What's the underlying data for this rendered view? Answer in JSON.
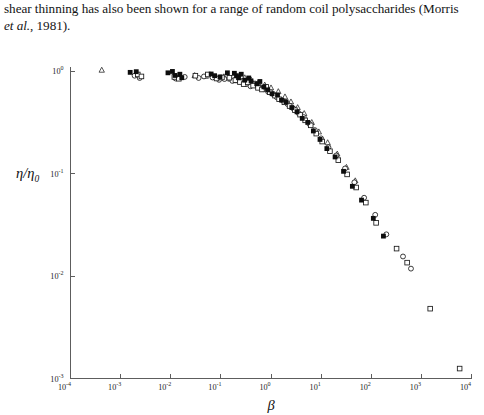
{
  "page": {
    "paragraph_line_1": "shear thinning has also been shown for a range of random coil polysaccharides (Morris",
    "paragraph_line_2_italic": "et al.",
    "paragraph_line_2_rest": ", 1981)."
  },
  "chart_data": {
    "type": "scatter",
    "title": "",
    "xlabel": "β",
    "ylabel": "η/η₀",
    "xscale": "log",
    "yscale": "log",
    "xlim": [
      0.0001,
      10000
    ],
    "ylim": [
      0.001,
      1
    ],
    "grid": false,
    "legend": "none",
    "xtick_labels": [
      "10-4",
      "10-3",
      "10-2",
      "10-1",
      "100",
      "101",
      "102",
      "103",
      "104"
    ],
    "xtick_mantissa": "10",
    "xtick_exponents": [
      "-4",
      "-3",
      "-2",
      "-1",
      "0",
      "1",
      "2",
      "3",
      "4"
    ],
    "ytick_mantissa": "10",
    "ytick_exponents": [
      "0",
      "-1",
      "-2",
      "-3"
    ],
    "series": [
      {
        "name": "filled-square",
        "marker": "filled-square",
        "points": [
          [
            0.00155,
            0.97
          ],
          [
            0.00205,
            0.985
          ],
          [
            0.0088,
            0.96
          ],
          [
            0.0108,
            0.99
          ],
          [
            0.0122,
            0.905
          ],
          [
            0.0152,
            0.93
          ],
          [
            0.0166,
            0.86
          ],
          [
            0.064,
            0.935
          ],
          [
            0.075,
            0.9
          ],
          [
            0.096,
            0.875
          ],
          [
            0.135,
            0.96
          ],
          [
            0.186,
            0.95
          ],
          [
            0.205,
            0.9
          ],
          [
            0.225,
            0.86
          ],
          [
            0.255,
            0.93
          ],
          [
            0.3,
            0.815
          ],
          [
            0.36,
            0.855
          ],
          [
            0.4,
            0.8
          ],
          [
            0.52,
            0.75
          ],
          [
            0.6,
            0.79
          ],
          [
            0.72,
            0.7
          ],
          [
            0.86,
            0.655
          ],
          [
            1.05,
            0.6
          ],
          [
            1.35,
            0.585
          ],
          [
            1.62,
            0.52
          ],
          [
            2.0,
            0.5
          ],
          [
            2.6,
            0.44
          ],
          [
            3.3,
            0.4
          ],
          [
            4.2,
            0.345
          ],
          [
            5.4,
            0.315
          ],
          [
            7.0,
            0.26
          ],
          [
            9.5,
            0.215
          ],
          [
            13.0,
            0.175
          ],
          [
            19.0,
            0.145
          ],
          [
            28.0,
            0.105
          ],
          [
            42.0,
            0.075
          ],
          [
            64.0,
            0.055
          ],
          [
            110.0,
            0.0365
          ],
          [
            175.0,
            0.0245
          ]
        ]
      },
      {
        "name": "open-square",
        "marker": "open-square",
        "points": [
          [
            0.0022,
            0.925
          ],
          [
            0.0026,
            0.885
          ],
          [
            0.0118,
            0.875
          ],
          [
            0.0145,
            0.84
          ],
          [
            0.031,
            0.9
          ],
          [
            0.055,
            0.925
          ],
          [
            0.082,
            0.845
          ],
          [
            0.105,
            0.865
          ],
          [
            0.148,
            0.86
          ],
          [
            0.195,
            0.815
          ],
          [
            0.24,
            0.78
          ],
          [
            0.285,
            0.745
          ],
          [
            0.345,
            0.775
          ],
          [
            0.44,
            0.72
          ],
          [
            0.55,
            0.685
          ],
          [
            0.66,
            0.66
          ],
          [
            0.8,
            0.7
          ],
          [
            0.95,
            0.62
          ],
          [
            1.2,
            0.575
          ],
          [
            1.45,
            0.53
          ],
          [
            1.85,
            0.495
          ],
          [
            2.35,
            0.455
          ],
          [
            3.0,
            0.415
          ],
          [
            3.8,
            0.375
          ],
          [
            4.8,
            0.33
          ],
          [
            6.2,
            0.295
          ],
          [
            8.0,
            0.245
          ],
          [
            10.5,
            0.205
          ],
          [
            15.0,
            0.165
          ],
          [
            22.0,
            0.135
          ],
          [
            33.0,
            0.098
          ],
          [
            50.0,
            0.073
          ],
          [
            78.0,
            0.052
          ],
          [
            125.0,
            0.033
          ],
          [
            320.0,
            0.0185
          ],
          [
            520.0,
            0.0135
          ],
          [
            1500.0,
            0.0048
          ],
          [
            5800.0,
            0.00125
          ]
        ]
      },
      {
        "name": "open-circle",
        "marker": "open-circle",
        "points": [
          [
            0.0019,
            0.9
          ],
          [
            0.0024,
            0.855
          ],
          [
            0.0125,
            0.845
          ],
          [
            0.019,
            0.875
          ],
          [
            0.036,
            0.855
          ],
          [
            0.046,
            0.885
          ],
          [
            0.068,
            0.865
          ],
          [
            0.092,
            0.82
          ],
          [
            0.118,
            0.835
          ],
          [
            0.17,
            0.8
          ],
          [
            0.215,
            0.855
          ],
          [
            0.265,
            0.8
          ],
          [
            0.32,
            0.745
          ],
          [
            0.39,
            0.71
          ],
          [
            0.48,
            0.755
          ],
          [
            0.58,
            0.7
          ],
          [
            0.7,
            0.665
          ],
          [
            0.88,
            0.625
          ],
          [
            1.1,
            0.595
          ],
          [
            1.3,
            0.555
          ],
          [
            1.7,
            0.515
          ],
          [
            2.15,
            0.475
          ],
          [
            2.8,
            0.43
          ],
          [
            3.5,
            0.39
          ],
          [
            4.5,
            0.355
          ],
          [
            5.8,
            0.305
          ],
          [
            7.5,
            0.265
          ],
          [
            10.0,
            0.22
          ],
          [
            14.0,
            0.18
          ],
          [
            20.0,
            0.15
          ],
          [
            30.0,
            0.112
          ],
          [
            46.0,
            0.082
          ],
          [
            72.0,
            0.058
          ],
          [
            120.0,
            0.0395
          ],
          [
            200.0,
            0.0255
          ],
          [
            430.0,
            0.0155
          ],
          [
            620.0,
            0.0118
          ]
        ]
      },
      {
        "name": "open-triangle",
        "marker": "open-triangle",
        "points": [
          [
            0.00042,
            1.02
          ],
          [
            0.0135,
            0.855
          ],
          [
            0.03,
            0.905
          ],
          [
            0.05,
            0.89
          ],
          [
            0.072,
            0.875
          ],
          [
            0.115,
            0.88
          ],
          [
            0.155,
            0.835
          ],
          [
            0.21,
            0.805
          ],
          [
            0.3,
            0.86
          ],
          [
            0.4,
            0.82
          ],
          [
            0.55,
            0.76
          ],
          [
            0.75,
            0.73
          ],
          [
            1.0,
            0.685
          ],
          [
            1.4,
            0.63
          ],
          [
            1.9,
            0.56
          ],
          [
            2.5,
            0.5
          ],
          [
            3.4,
            0.44
          ],
          [
            4.6,
            0.385
          ],
          [
            6.5,
            0.315
          ],
          [
            9.0,
            0.255
          ],
          [
            13.5,
            0.2
          ],
          [
            21.0,
            0.155
          ],
          [
            32.0,
            0.115
          ],
          [
            48.0,
            0.085
          ]
        ]
      }
    ]
  }
}
